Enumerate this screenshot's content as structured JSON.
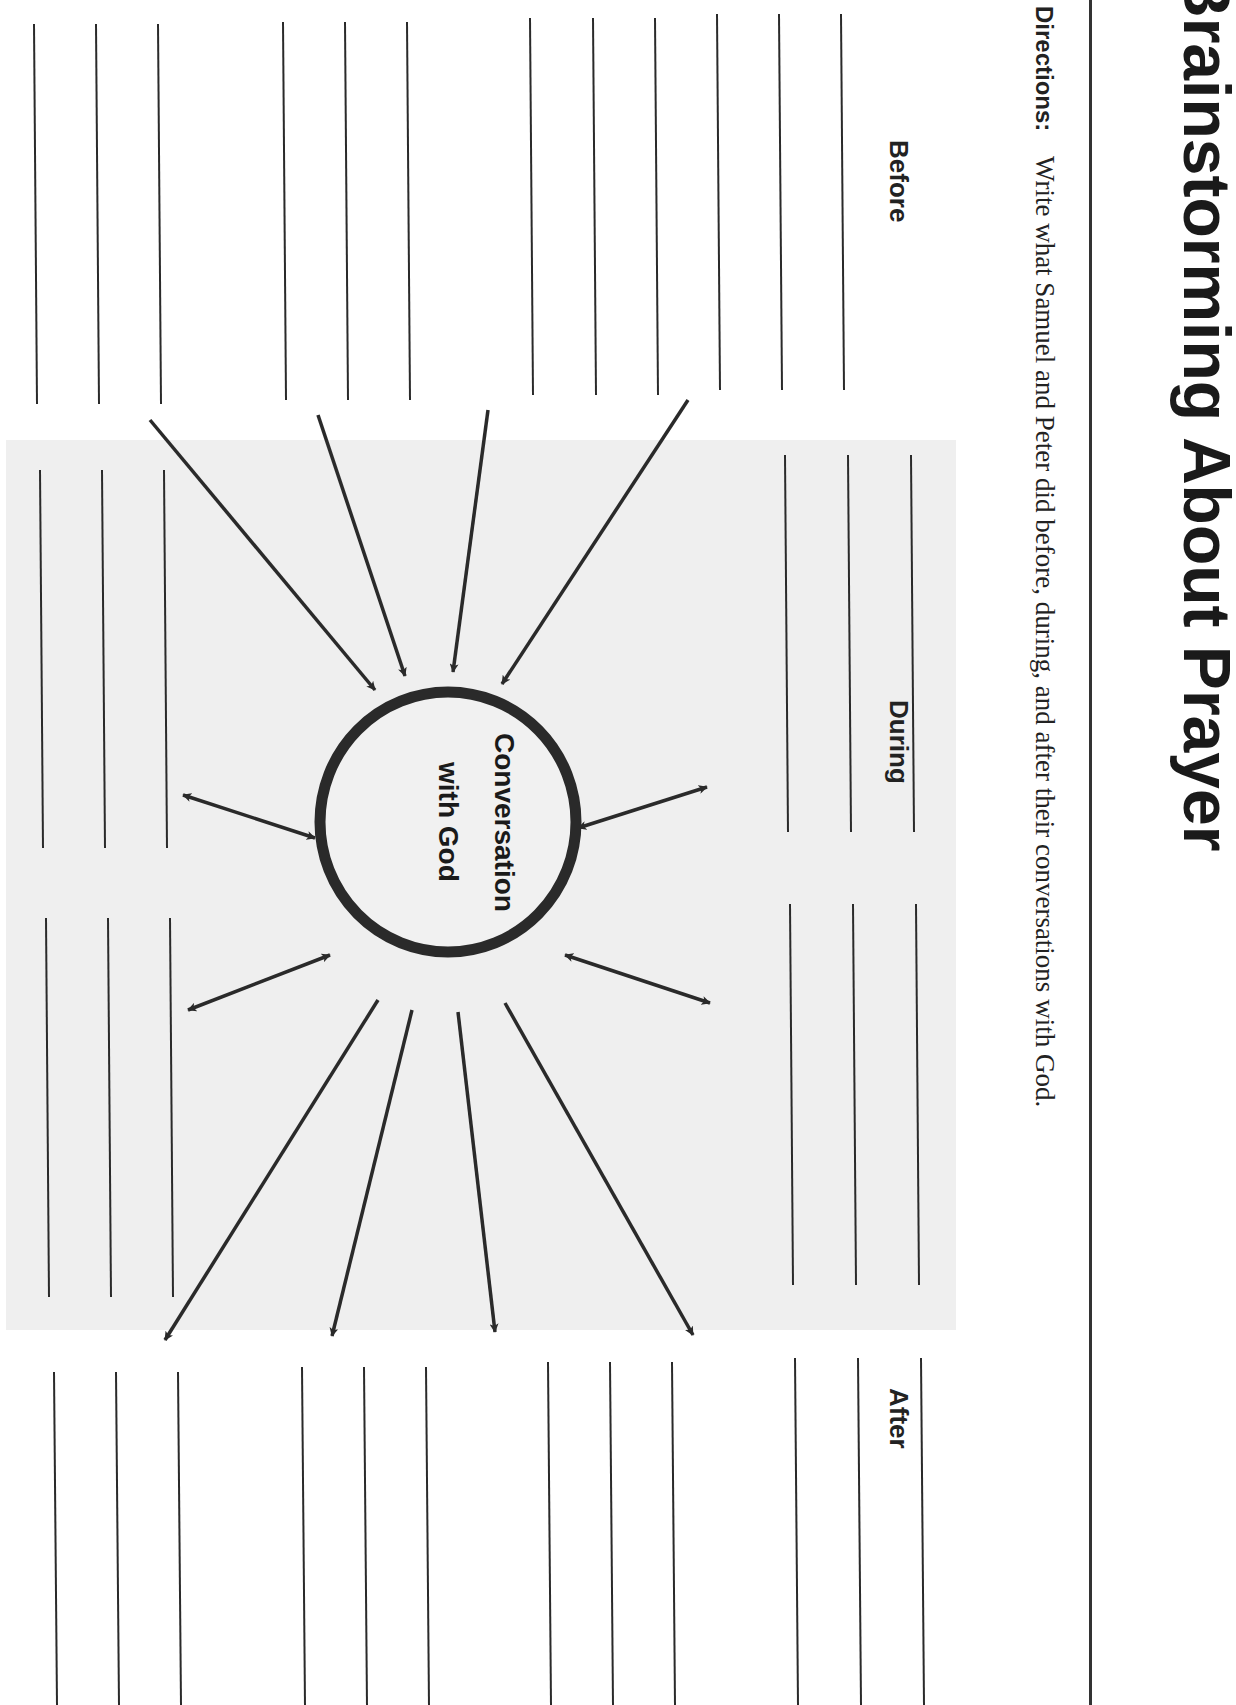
{
  "worksheet": {
    "title": "Brainstorming About Prayer",
    "directions_label": "Directions:",
    "directions_text": "Write what Samuel and Peter did before, during, and after their conversations with God.",
    "sections": {
      "before": "Before",
      "during": "During",
      "after": "After"
    },
    "center": {
      "line1": "Conversation",
      "line2": "with God"
    }
  },
  "diagram": {
    "ink_color": "#2a2a2a",
    "background_tint": "#efefef",
    "writing_lines": [
      {
        "group": "before-top",
        "x": [
          34,
          96,
          158
        ],
        "y1": 24,
        "y2": 404
      },
      {
        "group": "before-mid-left-a",
        "x": [
          283,
          345,
          407
        ],
        "y1": 22,
        "y2": 400
      },
      {
        "group": "before-mid-right",
        "x": [
          530,
          593,
          655
        ],
        "y1": 18,
        "y2": 395
      },
      {
        "group": "during-top",
        "x": [
          717,
          779,
          841
        ],
        "y1": 14,
        "y2": 390
      },
      {
        "group": "left-mid-a",
        "x": [
          40,
          102,
          164
        ],
        "y1": 470,
        "y2": 848
      },
      {
        "group": "left-mid-b",
        "x": [
          46,
          108,
          170
        ],
        "y1": 918,
        "y2": 1297
      },
      {
        "group": "right-mid-a",
        "x": [
          785,
          848,
          911
        ],
        "y1": 455,
        "y2": 832
      },
      {
        "group": "right-mid-b",
        "x": [
          790,
          853,
          916
        ],
        "y1": 904,
        "y2": 1285
      },
      {
        "group": "after-bottom-1",
        "x": [
          54,
          116,
          178
        ],
        "y1": 1372,
        "y2": 1705
      },
      {
        "group": "after-bottom-2",
        "x": [
          302,
          364,
          426
        ],
        "y1": 1367,
        "y2": 1705
      },
      {
        "group": "after-bottom-3",
        "x": [
          548,
          610,
          672
        ],
        "y1": 1362,
        "y2": 1705
      },
      {
        "group": "after-bottom-4",
        "x": [
          795,
          858,
          921
        ],
        "y1": 1358,
        "y2": 1705
      }
    ]
  }
}
